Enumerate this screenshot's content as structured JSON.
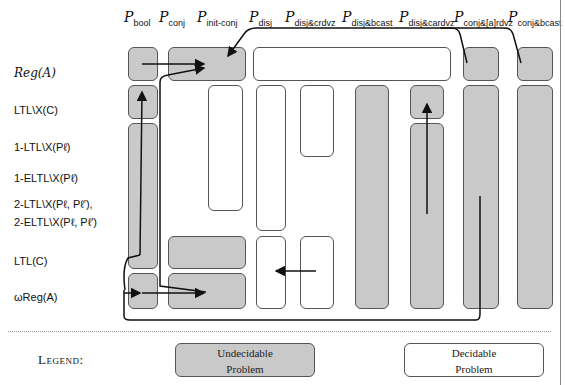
{
  "columns": [
    {
      "sub": "bool"
    },
    {
      "sub": "conj"
    },
    {
      "sub": "init-conj"
    },
    {
      "sub": "disj"
    },
    {
      "sub": "disj&crdvz"
    },
    {
      "sub": "disj&bcast"
    },
    {
      "sub": "disj&cardvz"
    },
    {
      "sub": "conj&[a]rdvz"
    },
    {
      "sub": "conj&bcast"
    }
  ],
  "column_symbol": "P",
  "rows": [
    {
      "label": "Reg(A)"
    },
    {
      "label": "LTL\\X(C)"
    },
    {
      "label": "1-LTL\\X(Pℓ)"
    },
    {
      "label": "1-ELTL\\X(Pℓ)"
    },
    {
      "label": "2-LTL\\X(Pℓ, Pℓ′),"
    },
    {
      "label": "2-ELTL\\X(Pℓ, Pℓ′)"
    },
    {
      "label": "LTL(C)"
    },
    {
      "label": "ωReg(A)"
    }
  ],
  "legend": {
    "title": "Legend:",
    "undecidable": {
      "line1": "Undecidable",
      "line2": "Problem",
      "color": "#c9c9c9"
    },
    "decidable": {
      "line1": "Decidable",
      "line2": "Problem",
      "color": "#ffffff"
    }
  },
  "colors": {
    "undecidable": "#c9c9c9",
    "decidable": "#ffffff",
    "border": "#555555",
    "arrow": "#111111"
  }
}
